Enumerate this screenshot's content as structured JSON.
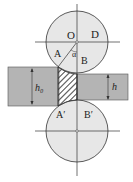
{
  "diagram": {
    "labels": {
      "O": "O",
      "D": "D",
      "A": "A",
      "alpha": "α",
      "B": "B",
      "A_prime": "A′",
      "B_prime": "B′",
      "h0": "h₀",
      "h": "h"
    },
    "colors": {
      "roll_fill": "#e6e6e6",
      "strip_fill": "#b4b4b4",
      "line": "#333333"
    }
  }
}
